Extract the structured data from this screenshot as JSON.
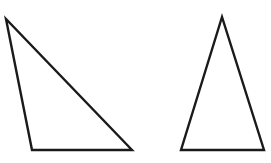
{
  "diagram": {
    "stroke_color": "#1a1a1a",
    "background": "#ffffff",
    "shapes": [
      {
        "name": "obtuse-scalene-triangle",
        "points": "6,19 32,150 132,150"
      },
      {
        "name": "isosceles-triangle",
        "points": "222,17 181,150 264,150"
      }
    ]
  }
}
